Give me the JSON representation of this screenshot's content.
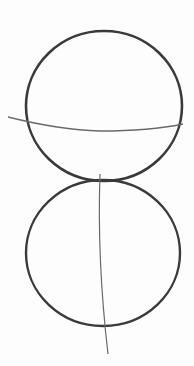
{
  "drawing": {
    "description": "Pencil sketch: two stacked circles with a horizontal guideline across the upper circle and a vertical guideline through the lower circle",
    "stroke_color": "#3a3a3a",
    "guide_color": "#6a6a6a",
    "background": "#fdfdfd",
    "shapes": {
      "upper_circle": {
        "cx": 104,
        "cy": 106,
        "rx": 78,
        "ry": 75
      },
      "lower_circle": {
        "cx": 103,
        "cy": 253,
        "rx": 77,
        "ry": 73
      },
      "horizontal_guide": {
        "d": "M 8 117 Q 60 130 100 131 Q 150 131 183 124"
      },
      "vertical_guide": {
        "d": "M 100 174 Q 97 260 108 354"
      }
    }
  }
}
